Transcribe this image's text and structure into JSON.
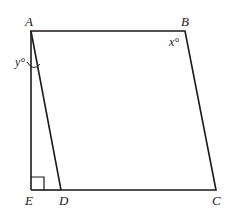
{
  "diagram": {
    "type": "geometry",
    "shape": "parallelogram ABCD with altitude AE",
    "points": {
      "A": {
        "label": "A",
        "x": 31,
        "y": 31
      },
      "B": {
        "label": "B",
        "x": 185,
        "y": 31
      },
      "C": {
        "label": "C",
        "x": 216,
        "y": 190
      },
      "D": {
        "label": "D",
        "x": 61,
        "y": 190
      },
      "E": {
        "label": "E",
        "x": 31,
        "y": 190
      }
    },
    "angles": {
      "x": {
        "label": "x°",
        "vertex": "B"
      },
      "y": {
        "label": "y°",
        "vertex": "A",
        "between": "AE and AD"
      }
    },
    "right_angle_at": "E",
    "colors": {
      "stroke": "#1a1a1a",
      "background": "#ffffff"
    }
  }
}
